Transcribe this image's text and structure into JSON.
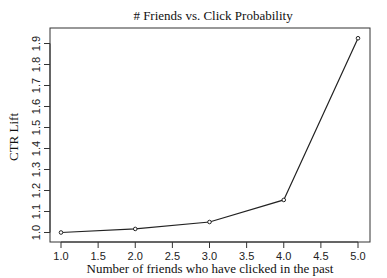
{
  "chart_data": {
    "type": "line",
    "title": "# Friends vs. Click Probability",
    "xlabel": "Number of friends who have clicked in the past",
    "ylabel": "CTR Lift",
    "x": [
      1.0,
      2.0,
      3.0,
      4.0,
      5.0
    ],
    "series": [
      {
        "name": "CTR Lift",
        "values": [
          1.0,
          1.017,
          1.05,
          1.155,
          1.925
        ]
      }
    ],
    "xticks": [
      "1.0",
      "1.5",
      "2.0",
      "2.5",
      "3.0",
      "3.5",
      "4.0",
      "4.5",
      "5.0"
    ],
    "yticks": [
      "1.0",
      "1.1",
      "1.2",
      "1.3",
      "1.4",
      "1.5",
      "1.6",
      "1.7",
      "1.8",
      "1.9"
    ],
    "xlim": [
      0.85,
      5.15
    ],
    "ylim": [
      0.97,
      1.96
    ],
    "grid": false,
    "legend": null,
    "marker": "open-circle",
    "line_color": "#222222"
  }
}
